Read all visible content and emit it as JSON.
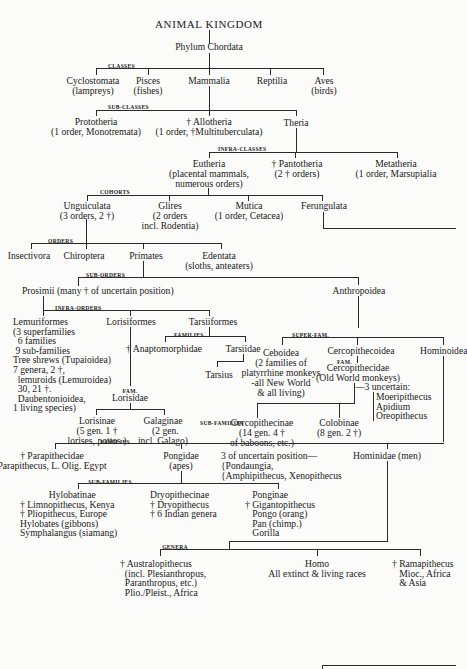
{
  "title": "ANIMAL KINGDOM",
  "phylum": "Phylum Chordata",
  "rank_labels": {
    "classes": "CLASSES",
    "sub_classes": "SUB-CLASSES",
    "infra_classes": "INFRA-CLASSES",
    "cohorts": "COHORTS",
    "orders": "ORDERS",
    "sub_orders": "SUB-ORDERS",
    "infra_orders": "INFRA-ORDERS",
    "families_tarsii": "FAMILIES",
    "fam_lorisidae": "FAM.",
    "super_fam": "SUPER-FAM.",
    "fam_cercopithecidae": "FAM.",
    "sub_families_cerco": "SUB-FAMILIES",
    "families_hominoidea": "FAMILIES",
    "sub_families_pongidae": "SUB-FAMILIES",
    "genera": "GENERA"
  },
  "classes": [
    {
      "name": "Cyclostomata",
      "note": "(lampreys)"
    },
    {
      "name": "Pisces",
      "note": "(fishes)"
    },
    {
      "name": "Mammalia",
      "note": ""
    },
    {
      "name": "Reptilia",
      "note": ""
    },
    {
      "name": "Aves",
      "note": "(birds)"
    }
  ],
  "sub_classes": [
    {
      "name": "Prototheria",
      "note": "(1 order, Monotremata)"
    },
    {
      "name": "† Allotheria",
      "note": "(1 order, †Multituberculata)"
    },
    {
      "name": "Theria",
      "note": ""
    }
  ],
  "infra_classes": [
    {
      "name": "Eutheria",
      "note1": "(placental mammals,",
      "note2": "numerous orders)"
    },
    {
      "name": "† Pantotheria",
      "note1": "(2 † orders)"
    },
    {
      "name": "Metatheria",
      "note1": "(1 order, Marsupialia"
    }
  ],
  "cohorts": [
    {
      "name": "Unguiculata",
      "note1": "(3 orders, 2 †)"
    },
    {
      "name": "Glires",
      "note1": "(2 orders",
      "note2": "incl. Rodentia)"
    },
    {
      "name": "Mutica",
      "note1": "(1 order, Cetacea)"
    },
    {
      "name": "Ferungulata"
    }
  ],
  "orders": [
    {
      "name": "Insectivora"
    },
    {
      "name": "Chiroptera"
    },
    {
      "name": "Primates"
    },
    {
      "name": "Edentata",
      "note": "(sloths, anteaters)"
    }
  ],
  "sub_orders": [
    {
      "name": "Prosimii (many † of uncertain position)"
    },
    {
      "name": "Anthropoidea"
    }
  ],
  "infra_orders": {
    "lemuriformes": {
      "name": "Lemuriformes",
      "lines": [
        "(3 superfamilies",
        "6 families",
        "9 sub-families",
        "Tree shrews (Tupaioidea)",
        "7 genera, 2 †,",
        "lemuroids (Lemuroidea)",
        "30, 21 †.",
        "Daubentonioidea,",
        "1 living species)"
      ]
    },
    "lorisiformes": {
      "name": "Lorisiformes"
    },
    "tarsiiformes": {
      "name": "Tarsiiformes"
    }
  },
  "tarsii_families": [
    "† Anaptomorphidae",
    "Tarsiidae"
  ],
  "tarsius": "Tarsius",
  "lorisidae": "Lorisidae",
  "lorisidae_subfamilies": [
    {
      "name": "Lorisinae",
      "lines": [
        "(5 gen. 1 †",
        "lorises, pottos.)"
      ]
    },
    {
      "name": "Galaginae",
      "lines": [
        "(2 gen.",
        "incl. Galago)"
      ]
    }
  ],
  "super_families": {
    "ceboidea": {
      "name": "Ceboidea",
      "lines": [
        "(2 families of",
        "platyrrhine monkeys",
        "-all New World",
        "& all living)"
      ]
    },
    "cercopithecoidea": {
      "name": "Cercopithecoidea"
    },
    "hominoidea": {
      "name": "Hominoidea"
    }
  },
  "cercopithecidae": {
    "name": "Cercopithecidae",
    "note": "(Old World monkeys)"
  },
  "uncertain_cerco": {
    "label": "—3 uncertain:",
    "items": [
      "Moeripithecus",
      "Apidium",
      "Oreopithecus"
    ]
  },
  "cerco_subfamilies": [
    {
      "name": "Cercopithecinae",
      "lines": [
        "(14 gen. 4 †",
        "of baboons, etc.)"
      ]
    },
    {
      "name": "Colobinae",
      "lines": [
        "(8 gen. 2 †)"
      ]
    }
  ],
  "hominoid_families": {
    "parapithecidae": {
      "name": "† Parapithecidae",
      "note": "Parapithecus, L. Olig. Egypt"
    },
    "pongidae": {
      "name": "Pongidae",
      "note": "(apes)"
    },
    "uncertain": {
      "line1": "3 of uncertain position—",
      "line2": "{Pondaungia,",
      "line3": "{Amphipithecus, Xenopithecus"
    },
    "hominidae": {
      "name": "Hominidae (men)"
    }
  },
  "pongidae_subfamilies": [
    {
      "name": "Hylobatinae",
      "lines": [
        "† Limnopithecus, Kenya",
        "† Pliopithecus, Europe",
        "Hylobates (gibbons)",
        "Symphalangus (siamang)"
      ]
    },
    {
      "name": "Dryopithecinae",
      "lines": [
        "† Dryopithecus",
        "† 6 Indian genera"
      ]
    },
    {
      "name": "Ponginae",
      "lines": [
        "† Gigantopithecus",
        "Pongo (orang)",
        "Pan (chimp.)",
        "Gorilla"
      ]
    }
  ],
  "genera": [
    {
      "name": "† Australopithecus",
      "lines": [
        "(incl. Plesianthropus,",
        "Paranthropus, etc.)",
        "Plio./Pleist., Africa"
      ]
    },
    {
      "name": "Homo",
      "lines": [
        "All extinct & living races"
      ]
    },
    {
      "name": "† Ramapithecus",
      "lines": [
        "Mioc., Africa",
        "& Asia"
      ]
    }
  ]
}
